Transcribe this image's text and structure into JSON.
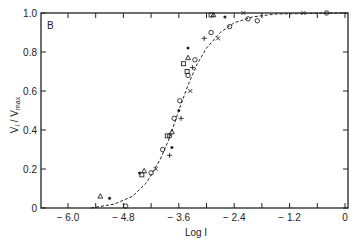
{
  "chart_data": {
    "type": "scatter",
    "title": "",
    "panel_label": "B",
    "xlabel": "Log I",
    "ylabel": "V_i / V_max",
    "xlim": [
      -6.6,
      0
    ],
    "ylim": [
      0,
      1.0
    ],
    "x_ticks": [
      -6.0,
      -4.8,
      -3.6,
      -2.4,
      -1.2,
      0
    ],
    "x_tick_labels": [
      "− 6.0",
      "− 4.8",
      "− 3.6",
      "− 2.4",
      "− 1.2",
      "0"
    ],
    "y_ticks": [
      0,
      0.2,
      0.4,
      0.6,
      0.8,
      1.0
    ],
    "y_tick_labels": [
      "0",
      "0.2",
      "0.4",
      "0.6",
      "0.8",
      "1.0"
    ],
    "grid": false,
    "legend": null,
    "fit_curve": {
      "style": "dashed",
      "description": "sigmoidal fit, midpoint near log I = -3.5",
      "points": [
        [
          -5.5,
          0.0
        ],
        [
          -5.0,
          0.02
        ],
        [
          -4.6,
          0.06
        ],
        [
          -4.3,
          0.13
        ],
        [
          -4.0,
          0.25
        ],
        [
          -3.8,
          0.36
        ],
        [
          -3.6,
          0.5
        ],
        [
          -3.4,
          0.63
        ],
        [
          -3.2,
          0.74
        ],
        [
          -3.0,
          0.82
        ],
        [
          -2.7,
          0.9
        ],
        [
          -2.4,
          0.95
        ],
        [
          -2.0,
          0.98
        ],
        [
          -1.5,
          0.995
        ],
        [
          0,
          1.0
        ]
      ]
    },
    "series": [
      {
        "name": "circles",
        "marker": "o",
        "points": [
          [
            -4.75,
            0.01
          ],
          [
            -4.2,
            0.18
          ],
          [
            -3.95,
            0.3
          ],
          [
            -3.8,
            0.37
          ],
          [
            -3.7,
            0.46
          ],
          [
            -3.58,
            0.55
          ],
          [
            -3.4,
            0.68
          ],
          [
            -3.25,
            0.76
          ],
          [
            -2.9,
            0.9
          ],
          [
            -2.5,
            0.93
          ],
          [
            -2.1,
            0.97
          ],
          [
            -1.9,
            0.96
          ],
          [
            -0.4,
            1.0
          ]
        ]
      },
      {
        "name": "triangles",
        "marker": "triangle",
        "points": [
          [
            -5.3,
            0.06
          ],
          [
            -4.35,
            0.19
          ],
          [
            -3.75,
            0.39
          ],
          [
            -3.4,
            0.77
          ],
          [
            -2.85,
            0.99
          ]
        ]
      },
      {
        "name": "squares",
        "marker": "square",
        "points": [
          [
            -4.4,
            0.17
          ],
          [
            -3.85,
            0.37
          ],
          [
            -3.5,
            0.74
          ],
          [
            -3.42,
            0.7
          ],
          [
            -2.9,
            0.99
          ]
        ]
      },
      {
        "name": "dots",
        "marker": "filled",
        "points": [
          [
            -5.1,
            0.05
          ],
          [
            -4.45,
            0.18
          ],
          [
            -3.75,
            0.31
          ],
          [
            -3.6,
            0.5
          ],
          [
            -3.4,
            0.82
          ],
          [
            -2.6,
            0.98
          ]
        ]
      },
      {
        "name": "crosses",
        "marker": "x",
        "points": [
          [
            -4.1,
            0.2
          ],
          [
            -3.35,
            0.6
          ],
          [
            -2.75,
            0.87
          ],
          [
            -2.2,
            1.0
          ],
          [
            -0.9,
            1.0
          ]
        ]
      },
      {
        "name": "plus",
        "marker": "+",
        "points": [
          [
            -3.8,
            0.27
          ],
          [
            -3.55,
            0.46
          ],
          [
            -3.3,
            0.72
          ],
          [
            -3.05,
            0.87
          ]
        ]
      }
    ]
  }
}
